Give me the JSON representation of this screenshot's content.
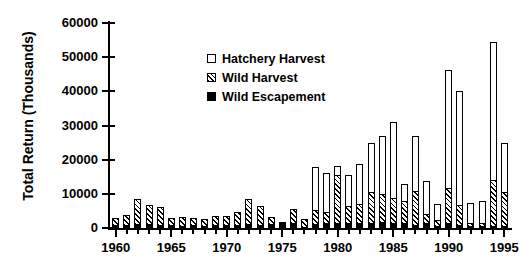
{
  "chart_data": {
    "type": "bar",
    "stacked": true,
    "title": "",
    "xlabel": "",
    "ylabel": "Total Return (Thousands)",
    "ylim": [
      0,
      60000
    ],
    "yticks": [
      0,
      10000,
      20000,
      30000,
      40000,
      50000,
      60000
    ],
    "ytick_labels": [
      "0",
      "10000",
      "20000",
      "30000",
      "40000",
      "50000",
      "60000"
    ],
    "xlim": [
      1959.3,
      1995.7
    ],
    "xticks": [
      1960,
      1965,
      1970,
      1975,
      1980,
      1985,
      1990,
      1995
    ],
    "xtick_labels": [
      "1960",
      "1965",
      "1970",
      "1975",
      "1980",
      "1985",
      "1990",
      "1995"
    ],
    "grid": false,
    "legend_position": "upper center",
    "categories": [
      1960,
      1961,
      1962,
      1963,
      1964,
      1965,
      1966,
      1967,
      1968,
      1969,
      1970,
      1971,
      1972,
      1973,
      1974,
      1975,
      1976,
      1977,
      1978,
      1979,
      1980,
      1981,
      1982,
      1983,
      1984,
      1985,
      1986,
      1987,
      1988,
      1989,
      1990,
      1991,
      1992,
      1993,
      1994,
      1995
    ],
    "series": [
      {
        "name": "Wild Escapement",
        "fill": "solid-black",
        "color": "#000000",
        "values": [
          900,
          1000,
          1300,
          1200,
          1000,
          800,
          700,
          800,
          700,
          900,
          900,
          900,
          1100,
          1000,
          1300,
          1400,
          1500,
          400,
          1300,
          1500,
          1400,
          1500,
          1500,
          1600,
          1700,
          1400,
          1600,
          1000,
          1400,
          700,
          1400,
          900,
          600,
          500,
          600,
          700
        ]
      },
      {
        "name": "Wild Harvest",
        "fill": "diagonal-hatch",
        "color": "#000000",
        "values": [
          2000,
          2800,
          7200,
          5600,
          5200,
          2200,
          2400,
          2200,
          1900,
          2600,
          2700,
          3700,
          7400,
          5400,
          2000,
          300,
          4100,
          2100,
          4000,
          3300,
          14200,
          5000,
          5500,
          8800,
          8400,
          7400,
          6300,
          9900,
          2800,
          1500,
          10400,
          5700,
          1000,
          1100,
          13400,
          9800
        ]
      },
      {
        "name": "Hatchery Harvest",
        "fill": "open-white",
        "color": "#ffffff",
        "values": [
          0,
          0,
          0,
          0,
          0,
          0,
          0,
          0,
          0,
          0,
          0,
          0,
          0,
          0,
          0,
          0,
          0,
          0,
          12700,
          11200,
          2500,
          9000,
          11700,
          14600,
          16900,
          22300,
          5100,
          16100,
          9600,
          4700,
          34400,
          33400,
          5700,
          6400,
          40500,
          14500
        ]
      }
    ],
    "totals": [
      2900,
      3800,
      8500,
      6800,
      6200,
      3000,
      3100,
      3000,
      2600,
      3500,
      3600,
      4600,
      8500,
      6400,
      3300,
      1700,
      5600,
      2500,
      18000,
      16000,
      18100,
      15500,
      18700,
      25000,
      27000,
      31100,
      13000,
      27000,
      13800,
      6900,
      46200,
      40000,
      7300,
      8000,
      54500,
      25000
    ]
  },
  "legend": {
    "items": [
      {
        "label": "Hatchery Harvest",
        "key": "hat"
      },
      {
        "label": "Wild Harvest",
        "key": "wild"
      },
      {
        "label": "Wild Escapement",
        "key": "esc"
      }
    ]
  }
}
